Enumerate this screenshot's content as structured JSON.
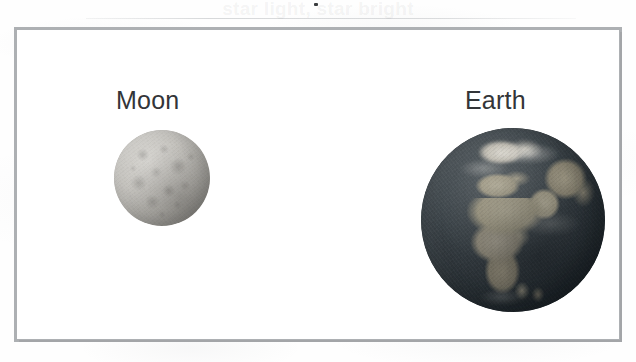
{
  "figure": {
    "caption_ghost": "star light, star bright",
    "frame_color": "#adb0b3",
    "background_color": "#ffffff"
  },
  "bodies": [
    {
      "id": "moon",
      "label": "Moon",
      "surface_color": "#b4b2ae",
      "relative_diameter_px": 96,
      "center_x": 145,
      "center_y": 148
    },
    {
      "id": "earth",
      "label": "Earth",
      "ocean_color": "#3a4247",
      "land_color": "#a8a18a",
      "relative_diameter_px": 184,
      "center_x": 496,
      "center_y": 190
    }
  ],
  "labels": {
    "moon": "Moon",
    "earth": "Earth"
  }
}
